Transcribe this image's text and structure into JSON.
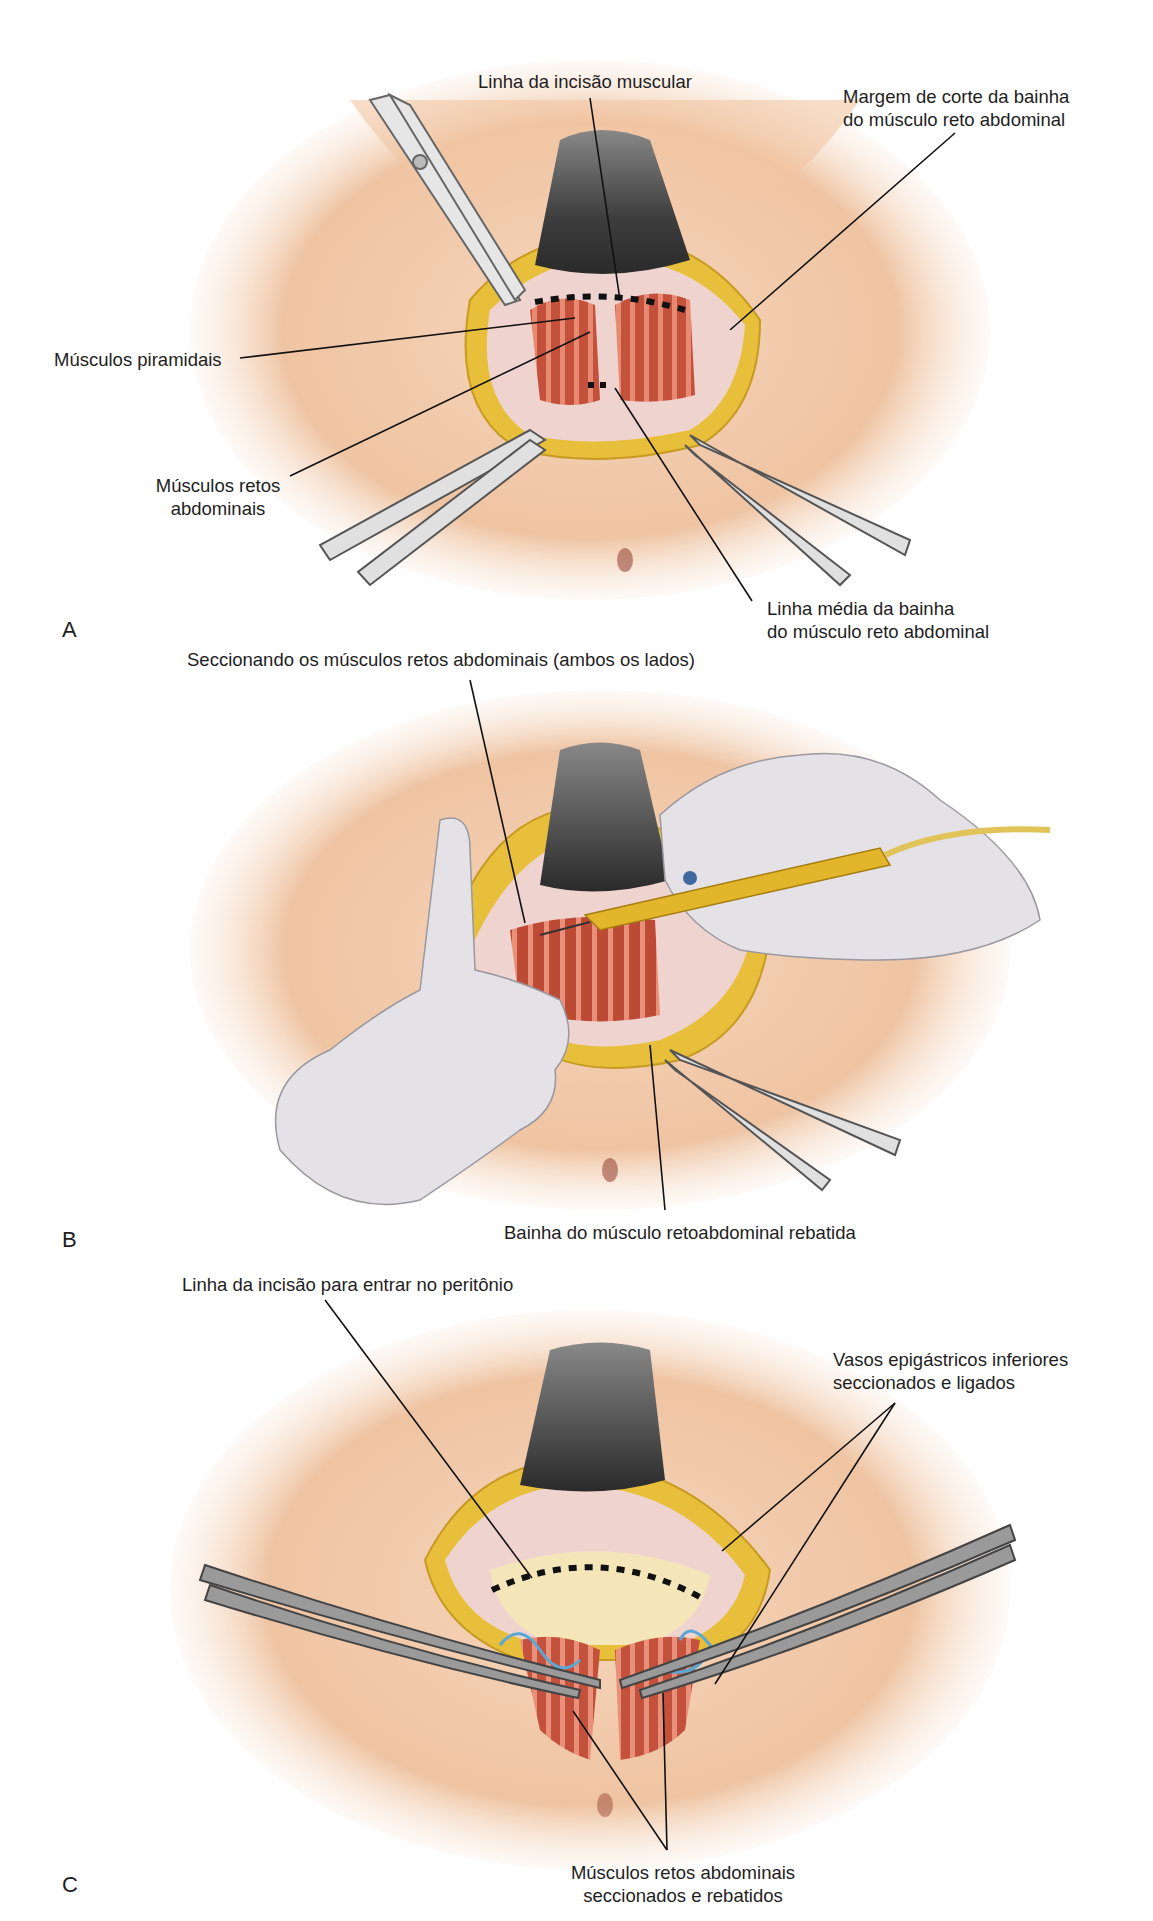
{
  "figure": {
    "header_fragment": "Laparotomia – exposição da pelve",
    "panels": [
      {
        "letter": "A",
        "labels": {
          "incision_line": "Linha da incisão muscular",
          "sheath_margin_line1": "Margem de corte da bainha",
          "sheath_margin_line2": "do músculo reto abdominal",
          "pyramidalis": "Músculos piramidais",
          "rectus_line1": "Músculos retos",
          "rectus_line2": "abdominais",
          "midline_line1": "Linha média da bainha",
          "midline_line2": "do músculo reto abdominal"
        }
      },
      {
        "letter": "B",
        "labels": {
          "sectioning": "Seccionando os músculos retos abdominais (ambos os lados)",
          "sheath_reflected": "Bainha do músculo retoabdominal rebatida"
        }
      },
      {
        "letter": "C",
        "labels": {
          "peritoneum_incision": "Linha da incisão para entrar no peritônio",
          "vessels_line1": "Vasos epigástricos inferiores",
          "vessels_line2": "seccionados e ligados",
          "rectus_cut_line1": "Músculos retos abdominais",
          "rectus_cut_line2": "seccionados e rebatidos"
        }
      }
    ],
    "colors": {
      "skin": "#f2c9a8",
      "skin_shadow": "#e2a784",
      "fat": "#e9c23c",
      "muscle": "#c8553f",
      "muscle_stripe": "#e88a72",
      "fascia": "#efd3cf",
      "retractor": "#5a5a5a",
      "instrument": "#d9d9d9",
      "glove": "#e4e2e6",
      "cautery": "#e2b52a",
      "vessel": "#5aa8d8",
      "peritoneum": "#f4e6b8",
      "leader": "#111111"
    }
  }
}
